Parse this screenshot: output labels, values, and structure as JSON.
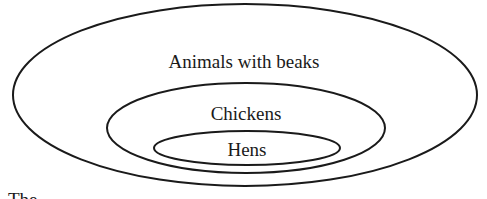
{
  "diagram": {
    "type": "nested-set-diagram",
    "sets": [
      {
        "id": "outer",
        "label": "Animals with beaks",
        "contains": "middle"
      },
      {
        "id": "middle",
        "label": "Chickens",
        "contains": "inner"
      },
      {
        "id": "inner",
        "label": "Hens",
        "contains": null
      }
    ],
    "stroke_color": "#1a1a1a",
    "background_color": "#ffffff"
  },
  "caption": {
    "fragment": "The  ..."
  }
}
